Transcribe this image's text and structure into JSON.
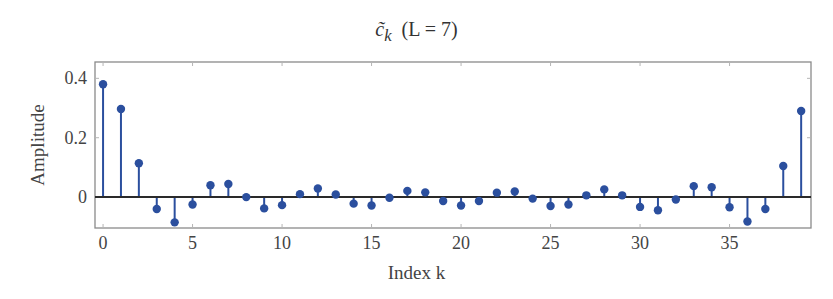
{
  "chart_data": {
    "type": "stem",
    "title_parts": {
      "symbol": "c̃",
      "subscript": "k",
      "suffix": "(L = 7)"
    },
    "xlabel": "Index k",
    "ylabel": "Amplitude",
    "xlim": [
      -0.45,
      39.55
    ],
    "ylim": [
      -0.104,
      0.455
    ],
    "xticks": [
      0,
      5,
      10,
      15,
      20,
      25,
      30,
      35
    ],
    "yticks": [
      0,
      0.2,
      0.4
    ],
    "ytick_labels": [
      "0",
      "0.2",
      "0.4"
    ],
    "grid": false,
    "baseline": 0,
    "x": [
      0,
      1,
      2,
      3,
      4,
      5,
      6,
      7,
      8,
      9,
      10,
      11,
      12,
      13,
      14,
      15,
      16,
      17,
      18,
      19,
      20,
      21,
      22,
      23,
      24,
      25,
      26,
      27,
      28,
      29,
      30,
      31,
      32,
      33,
      34,
      35,
      36,
      37,
      38,
      39
    ],
    "values": [
      0.38,
      0.297,
      0.114,
      -0.04,
      -0.085,
      -0.025,
      0.04,
      0.044,
      0.0,
      -0.038,
      -0.027,
      0.01,
      0.029,
      0.009,
      -0.022,
      -0.028,
      -0.002,
      0.021,
      0.016,
      -0.013,
      -0.028,
      -0.013,
      0.015,
      0.019,
      -0.005,
      -0.03,
      -0.025,
      0.006,
      0.026,
      0.006,
      -0.033,
      -0.044,
      -0.008,
      0.037,
      0.033,
      -0.034,
      -0.082,
      -0.04,
      0.105,
      0.29
    ],
    "color": "#2b4f9e",
    "baseline_color": "#2a2a2a",
    "frame_color": "#8a8a8a"
  }
}
